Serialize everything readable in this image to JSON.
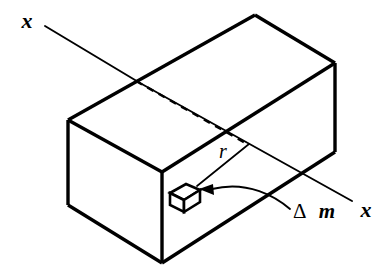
{
  "figure": {
    "background_color": "#ffffff",
    "line_color": "#000000",
    "width": 389,
    "height": 279
  },
  "labels": {
    "axis_left": "x",
    "axis_right": "x",
    "radius": "r",
    "mass_element_delta": "Δ",
    "mass_element_m": "m"
  },
  "geometry": {
    "solid": {
      "type": "rectangular-box-isometric",
      "top_face": [
        [
          68,
          120
        ],
        [
          255,
          15
        ],
        [
          335,
          63
        ],
        [
          162,
          172
        ]
      ],
      "left_face": [
        [
          68,
          120
        ],
        [
          162,
          172
        ],
        [
          162,
          263
        ],
        [
          68,
          205
        ]
      ],
      "right_face": [
        [
          162,
          172
        ],
        [
          335,
          63
        ],
        [
          335,
          152
        ],
        [
          162,
          263
        ]
      ],
      "hidden_edge": [
        [
          136,
          81
        ],
        [
          248,
          145
        ]
      ]
    },
    "axis": {
      "start": [
        45,
        26
      ],
      "end": [
        352,
        201
      ]
    },
    "radius_leader": {
      "start": [
        249,
        144
      ],
      "end": [
        196,
        186
      ]
    },
    "mass_element": {
      "center": [
        184,
        197
      ],
      "size": [
        32,
        26
      ]
    },
    "delta_m_leader": {
      "path": "M 287 206 C 275 196 250 181 210 189"
    }
  }
}
